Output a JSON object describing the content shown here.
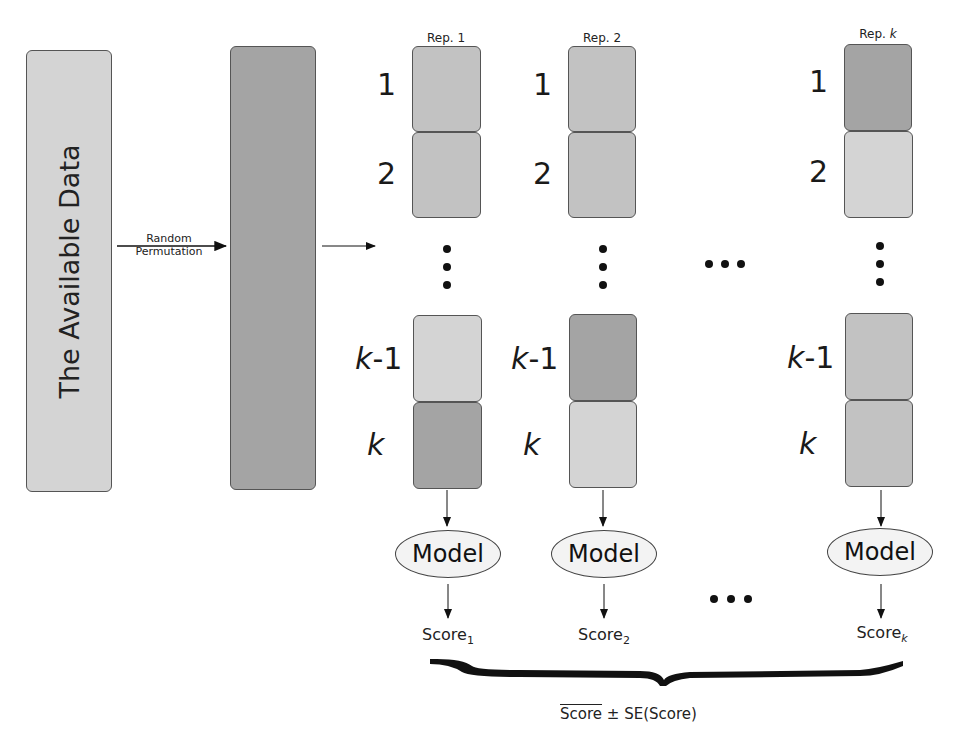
{
  "diagram": {
    "title_partial": "",
    "source_box": {
      "label": "The Available Data",
      "color": "#d6d6d6"
    },
    "permuted_box": {
      "color": "#a6a6a6"
    },
    "permutation_arrow": {
      "line1": "Random",
      "line2": "Permutation"
    },
    "fold_labels": {
      "fold1": "1",
      "fold2": "2",
      "fold_k_minus_1_var": "k",
      "fold_k_minus_1_suffix": "-1",
      "fold_k": "k"
    },
    "repetitions": [
      {
        "label": "Rep. ",
        "label_suffix": "1",
        "label_suffix_italic": false,
        "test_fold": "k",
        "model_label": "Model",
        "score_label": "Score",
        "score_sub": "1"
      },
      {
        "label": "Rep. ",
        "label_suffix": "2",
        "label_suffix_italic": false,
        "test_fold": "k-1",
        "model_label": "Model",
        "score_label": "Score",
        "score_sub": "2"
      },
      {
        "label": "Rep. ",
        "label_suffix": "k",
        "label_suffix_italic": true,
        "test_fold": "1",
        "model_label": "Model",
        "score_label": "Score",
        "score_sub": "k"
      }
    ],
    "ellipsis_between_reps": "…",
    "summary": {
      "mean_label": "Score",
      "pm": "±",
      "se_label": "SE(Score)"
    },
    "colors": {
      "train_fold": "#c4c4c4",
      "test_fold": "#a4a4a4",
      "border": "#555555",
      "text": "#1a1a1a"
    }
  }
}
